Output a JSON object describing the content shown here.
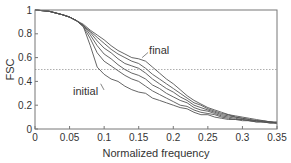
{
  "chart_data": {
    "type": "line",
    "title": "",
    "xlabel": "Normalized frequency",
    "ylabel": "FSC",
    "xlim": [
      0,
      0.35
    ],
    "ylim": [
      0,
      1
    ],
    "xticks": [
      0,
      0.05,
      0.1,
      0.15,
      0.2,
      0.25,
      0.3,
      0.35
    ],
    "xtick_labels": [
      "0",
      "0.05",
      "0.1",
      "0.15",
      "0.2",
      "0.25",
      "0.3",
      "0.35"
    ],
    "yticks": [
      0,
      0.2,
      0.4,
      0.6,
      0.8,
      1
    ],
    "ytick_labels": [
      "0",
      "0.2",
      "0.4",
      "0.6",
      "0.8",
      "1"
    ],
    "grid": false,
    "threshold_line": {
      "y": 0.5,
      "style": "dotted"
    },
    "annotations": [
      {
        "text": "final",
        "x": 0.165,
        "y": 0.66,
        "points_to": {
          "x": 0.155,
          "y": 0.6
        }
      },
      {
        "text": "initial",
        "x": 0.055,
        "y": 0.32,
        "points_to": {
          "x": 0.095,
          "y": 0.38
        }
      }
    ],
    "x": [
      0,
      0.02,
      0.04,
      0.05,
      0.06,
      0.07,
      0.08,
      0.09,
      0.1,
      0.11,
      0.12,
      0.13,
      0.14,
      0.15,
      0.16,
      0.17,
      0.18,
      0.19,
      0.2,
      0.21,
      0.22,
      0.23,
      0.24,
      0.25,
      0.26,
      0.27,
      0.28,
      0.29,
      0.3,
      0.31,
      0.32,
      0.33,
      0.34,
      0.35
    ],
    "series": [
      {
        "name": "initial",
        "values": [
          1.0,
          0.99,
          0.96,
          0.94,
          0.91,
          0.86,
          0.7,
          0.52,
          0.46,
          0.42,
          0.4,
          0.36,
          0.33,
          0.31,
          0.3,
          0.26,
          0.24,
          0.22,
          0.2,
          0.18,
          0.17,
          0.14,
          0.12,
          0.12,
          0.1,
          0.09,
          0.08,
          0.08,
          0.07,
          0.07,
          0.06,
          0.06,
          0.05,
          0.05
        ]
      },
      {
        "name": "iteration 2",
        "values": [
          1.0,
          0.99,
          0.96,
          0.94,
          0.91,
          0.86,
          0.76,
          0.64,
          0.57,
          0.53,
          0.49,
          0.45,
          0.42,
          0.4,
          0.36,
          0.32,
          0.29,
          0.26,
          0.23,
          0.2,
          0.19,
          0.16,
          0.14,
          0.13,
          0.12,
          0.1,
          0.09,
          0.08,
          0.08,
          0.07,
          0.06,
          0.06,
          0.05,
          0.05
        ]
      },
      {
        "name": "iteration 3",
        "values": [
          1.0,
          0.99,
          0.96,
          0.94,
          0.91,
          0.87,
          0.79,
          0.7,
          0.63,
          0.59,
          0.54,
          0.5,
          0.47,
          0.45,
          0.42,
          0.37,
          0.34,
          0.3,
          0.27,
          0.24,
          0.22,
          0.18,
          0.16,
          0.15,
          0.13,
          0.11,
          0.1,
          0.09,
          0.08,
          0.07,
          0.07,
          0.06,
          0.06,
          0.05
        ]
      },
      {
        "name": "iteration 4",
        "values": [
          1.0,
          0.99,
          0.96,
          0.94,
          0.91,
          0.87,
          0.81,
          0.74,
          0.68,
          0.64,
          0.59,
          0.55,
          0.53,
          0.51,
          0.47,
          0.42,
          0.38,
          0.34,
          0.31,
          0.27,
          0.24,
          0.2,
          0.18,
          0.16,
          0.14,
          0.12,
          0.11,
          0.1,
          0.09,
          0.08,
          0.07,
          0.06,
          0.06,
          0.05
        ]
      },
      {
        "name": "iteration 5",
        "values": [
          1.0,
          0.99,
          0.96,
          0.94,
          0.91,
          0.87,
          0.82,
          0.77,
          0.72,
          0.67,
          0.63,
          0.6,
          0.57,
          0.55,
          0.51,
          0.46,
          0.42,
          0.38,
          0.34,
          0.3,
          0.26,
          0.22,
          0.2,
          0.17,
          0.15,
          0.13,
          0.12,
          0.1,
          0.09,
          0.08,
          0.07,
          0.07,
          0.06,
          0.05
        ]
      },
      {
        "name": "final",
        "values": [
          1.0,
          0.99,
          0.96,
          0.94,
          0.91,
          0.88,
          0.83,
          0.79,
          0.75,
          0.7,
          0.66,
          0.63,
          0.6,
          0.59,
          0.57,
          0.52,
          0.47,
          0.42,
          0.38,
          0.33,
          0.28,
          0.24,
          0.21,
          0.18,
          0.16,
          0.14,
          0.12,
          0.11,
          0.1,
          0.09,
          0.08,
          0.07,
          0.06,
          0.06
        ]
      }
    ]
  },
  "plot": {
    "left": 35,
    "top": 10,
    "right": 277,
    "bottom": 129
  },
  "colors": {
    "curve": "#555555",
    "frame": "#777777",
    "threshold": "#9a9a9a",
    "text": "#333333"
  }
}
